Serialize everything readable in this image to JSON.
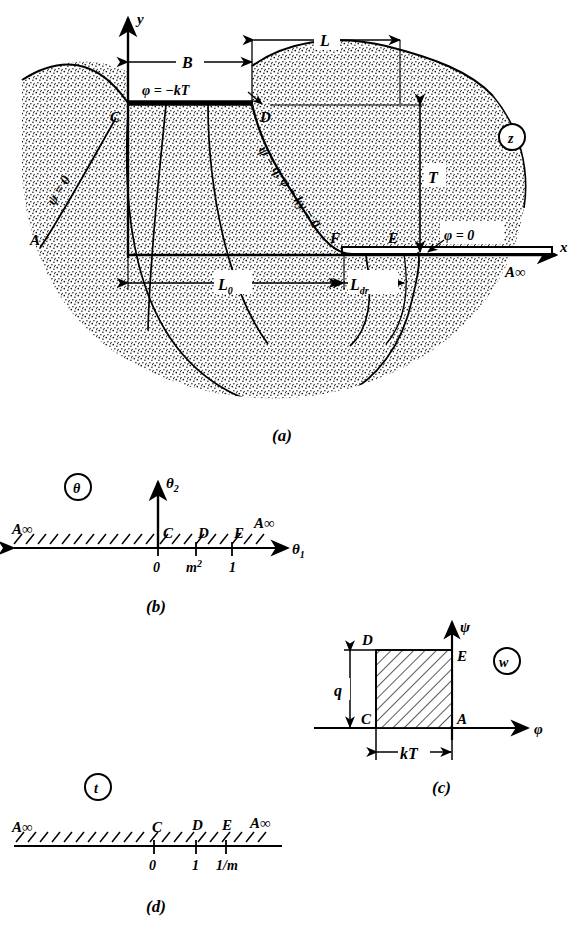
{
  "figure": {
    "panels": [
      {
        "id": "a",
        "caption": "(a)",
        "plane_marker": "z",
        "axes": {
          "x": "x",
          "y": "y"
        },
        "points": [
          "A",
          "C",
          "D",
          "E",
          "F"
        ],
        "infinity_label": "A∞",
        "boundary_conditions": [
          "φ = −kT",
          "ψ = 0",
          "ψ = q,  φ + ky = 0",
          "φ = 0"
        ],
        "dimensions": [
          "B",
          "L",
          "T",
          "L",
          "L"
        ],
        "dimension_labels": {
          "B": "B",
          "L": "L",
          "T": "T",
          "L0": "L",
          "L0_sub": "0",
          "Ldr": "L",
          "Ldr_sub": "dr"
        }
      },
      {
        "id": "b",
        "caption": "(b)",
        "plane_marker": "θ",
        "axes": {
          "x": "θ",
          "x_sub": "1",
          "y": "θ",
          "y_sub": "2"
        },
        "infinity_label": "A∞",
        "points_on_axis": [
          {
            "letter": "C",
            "value": "0"
          },
          {
            "letter": "D",
            "value": "m",
            "value_sup": "2"
          },
          {
            "letter": "E",
            "value": "1"
          }
        ]
      },
      {
        "id": "c",
        "caption": "(c)",
        "plane_marker": "w",
        "axes": {
          "x": "φ",
          "y": "ψ"
        },
        "corners": {
          "bottom_left": "C",
          "top_left": "D",
          "top_right": "E",
          "bottom_right": "A"
        },
        "dimensions": {
          "height": "q",
          "width": "kT"
        }
      },
      {
        "id": "d",
        "caption": "(d)",
        "plane_marker": "t",
        "infinity_label": "A∞",
        "points_on_axis": [
          {
            "letter": "C",
            "value": "0"
          },
          {
            "letter": "D",
            "value": "1"
          },
          {
            "letter": "E",
            "value": "1/m"
          }
        ]
      }
    ]
  },
  "colors": {
    "ink": "#000000",
    "paper": "#ffffff",
    "stipple": "#1a1a1a"
  }
}
